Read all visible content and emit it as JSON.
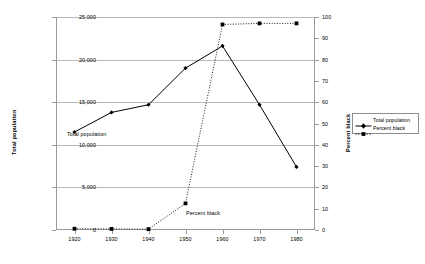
{
  "chart_data": {
    "type": "line",
    "title": "",
    "xlabel": "",
    "x": [
      1920,
      1930,
      1940,
      1950,
      1960,
      1970,
      1980
    ],
    "xticklabels": [
      "1920",
      "1930",
      "1940",
      "1950",
      "1960",
      "1970",
      "1980"
    ],
    "xlim": [
      1915,
      1985
    ],
    "grid": true,
    "legend_position": "right-outside",
    "axes": {
      "left": {
        "label": "Total population",
        "ticks": [
          0,
          5000,
          10000,
          15000,
          20000,
          25000
        ],
        "ticklabels": [
          "0",
          "5,000",
          "10,000",
          "15,000",
          "20,000",
          "25,000"
        ],
        "lim": [
          0,
          25000
        ]
      },
      "right": {
        "label": "Percent black",
        "ticks": [
          0,
          10,
          20,
          30,
          40,
          50,
          60,
          70,
          80,
          90,
          100
        ],
        "ticklabels": [
          "0",
          "10",
          "20",
          "30",
          "40",
          "50",
          "60",
          "70",
          "80",
          "90",
          "100"
        ],
        "lim": [
          0,
          100
        ]
      }
    },
    "series": [
      {
        "name": "Total population",
        "axis": "left",
        "line_style": "solid",
        "marker": "diamond",
        "color": "#000000",
        "values": [
          11500,
          13800,
          14700,
          19000,
          21600,
          14700,
          7400
        ]
      },
      {
        "name": "Percent black",
        "axis": "right",
        "line_style": "dotted",
        "marker": "square",
        "color": "#000000",
        "values": [
          0.6,
          0.5,
          0.4,
          12.5,
          96.5,
          97.0,
          97.0
        ]
      }
    ],
    "annotations": [
      {
        "text": "Total population",
        "near_x": 1920,
        "series": "Total population"
      },
      {
        "text": "Percent black",
        "near_x": 1950,
        "series": "Percent black"
      }
    ]
  },
  "legend": {
    "items": [
      {
        "label": "Total population",
        "style": "solid",
        "marker": "diamond"
      },
      {
        "label": "Percent black",
        "style": "dotted",
        "marker": "square"
      }
    ]
  },
  "colors": {
    "background": "#ffffff",
    "axis": "#9a9a9a",
    "gridline": "#b9b9b9",
    "series": "#000000",
    "text": "#000000"
  }
}
